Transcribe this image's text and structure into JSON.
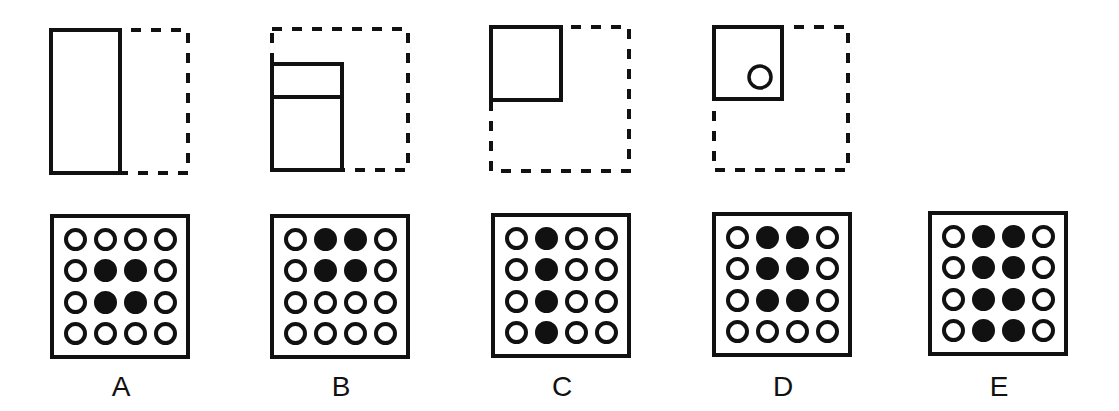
{
  "puzzle": {
    "stroke_color": "#111111",
    "top_figures": [
      {
        "id": "A",
        "dashed_frame": {
          "x": 51,
          "y": 30,
          "w": 137,
          "h": 143
        },
        "solid_shapes": [
          {
            "type": "rect",
            "x": 51,
            "y": 30,
            "w": 69,
            "h": 143
          }
        ],
        "circles": []
      },
      {
        "id": "B",
        "dashed_frame": {
          "x": 272,
          "y": 29,
          "w": 136,
          "h": 141
        },
        "solid_shapes": [
          {
            "type": "rect",
            "x": 272,
            "y": 64,
            "w": 70,
            "h": 106
          },
          {
            "type": "line",
            "x1": 272,
            "y1": 97,
            "x2": 342,
            "y2": 97
          }
        ],
        "circles": []
      },
      {
        "id": "C",
        "dashed_frame": {
          "x": 491,
          "y": 27,
          "w": 138,
          "h": 144
        },
        "solid_shapes": [
          {
            "type": "rect",
            "x": 491,
            "y": 27,
            "w": 70,
            "h": 73
          }
        ],
        "circles": []
      },
      {
        "id": "D",
        "dashed_frame": {
          "x": 714,
          "y": 27,
          "w": 134,
          "h": 143
        },
        "solid_shapes": [
          {
            "type": "rect",
            "x": 714,
            "y": 27,
            "w": 68,
            "h": 72
          }
        ],
        "circles": [
          {
            "cx": 760,
            "cy": 77,
            "r": 11
          }
        ]
      }
    ],
    "options": [
      {
        "label": "A",
        "box": {
          "x": 50,
          "y": 214,
          "w": 140,
          "h": 145
        },
        "grid": [
          [
            0,
            0,
            0,
            0
          ],
          [
            0,
            1,
            1,
            0
          ],
          [
            0,
            1,
            1,
            0
          ],
          [
            0,
            0,
            0,
            0
          ]
        ],
        "label_pos": {
          "x": 101,
          "y": 372
        }
      },
      {
        "label": "B",
        "box": {
          "x": 270,
          "y": 214,
          "w": 140,
          "h": 145
        },
        "grid": [
          [
            0,
            1,
            1,
            0
          ],
          [
            0,
            1,
            1,
            0
          ],
          [
            0,
            0,
            0,
            0
          ],
          [
            0,
            0,
            0,
            0
          ]
        ],
        "label_pos": {
          "x": 321,
          "y": 372
        }
      },
      {
        "label": "C",
        "box": {
          "x": 491,
          "y": 213,
          "w": 140,
          "h": 145
        },
        "grid": [
          [
            0,
            1,
            0,
            0
          ],
          [
            0,
            1,
            0,
            0
          ],
          [
            0,
            1,
            0,
            0
          ],
          [
            0,
            1,
            0,
            0
          ]
        ],
        "label_pos": {
          "x": 542,
          "y": 372
        }
      },
      {
        "label": "D",
        "box": {
          "x": 712,
          "y": 212,
          "w": 140,
          "h": 145
        },
        "grid": [
          [
            0,
            1,
            1,
            0
          ],
          [
            0,
            1,
            1,
            0
          ],
          [
            0,
            1,
            1,
            0
          ],
          [
            0,
            0,
            0,
            0
          ]
        ],
        "label_pos": {
          "x": 763,
          "y": 372
        }
      },
      {
        "label": "E",
        "box": {
          "x": 928,
          "y": 211,
          "w": 140,
          "h": 145
        },
        "grid": [
          [
            0,
            1,
            1,
            0
          ],
          [
            0,
            1,
            1,
            0
          ],
          [
            0,
            1,
            1,
            0
          ],
          [
            0,
            1,
            1,
            0
          ]
        ],
        "label_pos": {
          "x": 979,
          "y": 372
        }
      }
    ]
  }
}
